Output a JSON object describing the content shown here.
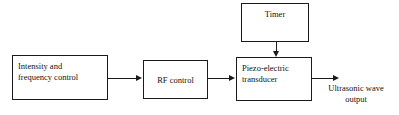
{
  "diagram": {
    "type": "block-diagram",
    "background_color": "#ffffff",
    "line_color": "#1a1a1a",
    "text_color": "#121212",
    "blocks": [
      {
        "id": "intensity-frequency-control",
        "label": "Intensity and\nfrequency control",
        "align": "left",
        "x": 12,
        "y": 55,
        "width": 96,
        "height": 45
      },
      {
        "id": "rf-control",
        "label": "RF control",
        "align": "center-middle",
        "x": 143,
        "y": 60,
        "width": 65,
        "height": 39
      },
      {
        "id": "piezo-electric-transducer",
        "label": "Piezo-electric\ntransducer",
        "align": "left",
        "x": 236,
        "y": 57,
        "width": 76,
        "height": 44
      },
      {
        "id": "timer",
        "label": "Timer",
        "align": "center-top",
        "x": 241,
        "y": 3,
        "width": 68,
        "height": 39
      }
    ],
    "connectors": [
      {
        "id": "intensity-to-rf",
        "from": "intensity-frequency-control",
        "to": "rf-control",
        "direction": "right"
      },
      {
        "id": "rf-to-transducer",
        "from": "rf-control",
        "to": "piezo-electric-transducer",
        "direction": "right"
      },
      {
        "id": "timer-to-transducer",
        "from": "timer",
        "to": "piezo-electric-transducer",
        "direction": "down"
      },
      {
        "id": "transducer-to-output",
        "from": "piezo-electric-transducer",
        "to": "ultrasonic-wave-output",
        "direction": "right"
      }
    ],
    "labels": [
      {
        "id": "ultrasonic-wave-output",
        "text": "Ultrasonic wave\noutput",
        "x": 316,
        "y": 83,
        "width": 80
      }
    ]
  }
}
